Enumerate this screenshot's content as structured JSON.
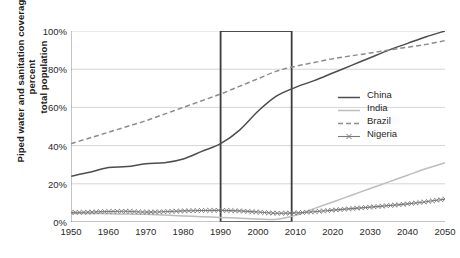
{
  "chart_data": {
    "type": "line",
    "title": "",
    "xlabel": "",
    "ylabel": "Piped water and sanitation coverage, percent\ntotal population",
    "xlim": [
      1950,
      2050
    ],
    "ylim": [
      0,
      100
    ],
    "xticks": [
      1950,
      1960,
      1970,
      1980,
      1990,
      2000,
      2010,
      2020,
      2030,
      2040,
      2050
    ],
    "xtick_labels": [
      "1950",
      "1960",
      "1970",
      "1980",
      "1990",
      "2000",
      "2010",
      "2020",
      "2030",
      "2040",
      "2050"
    ],
    "yticks": [
      0,
      20,
      40,
      60,
      80,
      100
    ],
    "ytick_labels": [
      "0%",
      "20%",
      "40%",
      "60%",
      "80%",
      "100%"
    ],
    "x_minor_step": 5,
    "y_minor_step": 5,
    "grid": "horizontal",
    "legend_position": "right-center",
    "highlight_box": {
      "x_start": 1990,
      "x_end": 2009,
      "y_start": 0,
      "y_end": 100,
      "stroke": "#3c3c3c"
    },
    "x": [
      1950,
      1955,
      1960,
      1965,
      1970,
      1975,
      1980,
      1985,
      1990,
      1995,
      2000,
      2005,
      2010,
      2015,
      2020,
      2025,
      2030,
      2035,
      2040,
      2045,
      2050
    ],
    "series": [
      {
        "name": "China",
        "style": "solid",
        "color": "#4d4d4d",
        "values": [
          24,
          26,
          28.5,
          29,
          30.5,
          31,
          33,
          37,
          41,
          48,
          58,
          66,
          70.5,
          74,
          78,
          82,
          86,
          90,
          93.5,
          97,
          100
        ]
      },
      {
        "name": "India",
        "style": "solid",
        "color": "#bdbdbd",
        "values": [
          4.5,
          4.5,
          4.3,
          4.2,
          4.0,
          3.6,
          3.2,
          2.8,
          2.4,
          2.0,
          1.6,
          1.4,
          3.5,
          7,
          10.5,
          14,
          17.5,
          21,
          24.5,
          28,
          31
        ]
      },
      {
        "name": "Brazil",
        "style": "dashed",
        "color": "#8c8c8c",
        "values": [
          41,
          44,
          47,
          50,
          53,
          56.5,
          60,
          63.5,
          67,
          71,
          75,
          79,
          81.5,
          83.5,
          85.5,
          87,
          88.5,
          90,
          91.5,
          93,
          95
        ]
      },
      {
        "name": "Nigeria",
        "style": "marker-x",
        "color": "#7a7a7a",
        "values": [
          5,
          5.2,
          5.5,
          5.6,
          5.2,
          5.4,
          5.8,
          6.0,
          6.1,
          5.8,
          5.2,
          4.6,
          4.8,
          5.4,
          6.2,
          7.0,
          7.8,
          8.6,
          9.5,
          10.6,
          12
        ]
      }
    ]
  },
  "legend": {
    "items": [
      {
        "label": "China"
      },
      {
        "label": "India"
      },
      {
        "label": "Brazil"
      },
      {
        "label": "Nigeria"
      }
    ]
  },
  "caption": ""
}
